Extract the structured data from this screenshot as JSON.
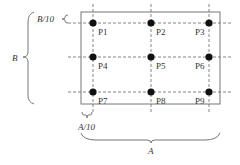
{
  "diagram": {
    "dimension_labels": {
      "height": "B",
      "height_margin": "B/10",
      "width": "A",
      "width_margin": "A/10"
    },
    "grid": {
      "rows": 3,
      "cols": 3,
      "margin_fraction": 0.1
    },
    "points": [
      {
        "label": "P1"
      },
      {
        "label": "P2"
      },
      {
        "label": "P3"
      },
      {
        "label": "P4"
      },
      {
        "label": "P5"
      },
      {
        "label": "P6"
      },
      {
        "label": "P7"
      },
      {
        "label": "P8"
      },
      {
        "label": "P9"
      }
    ],
    "colors": {
      "line": "#666666",
      "point": "#111111",
      "text": "#333333"
    }
  }
}
